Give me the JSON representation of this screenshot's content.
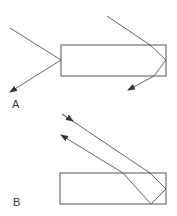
{
  "panels": [
    {
      "label": "A",
      "label_pos": [
        12,
        98
      ],
      "block": {
        "x": 61,
        "y": 45,
        "w": 105,
        "h": 31
      },
      "rays": [
        {
          "name": "ray-a-left",
          "points": [
            [
              10,
              28
            ],
            [
              61,
              60
            ],
            [
              10,
              92
            ]
          ],
          "arrow": "end"
        },
        {
          "name": "ray-a-right",
          "points": [
            [
              107,
              16
            ],
            [
              150,
              45
            ],
            [
              166,
              60
            ],
            [
              154,
              76
            ],
            [
              128,
              90
            ]
          ],
          "arrow": "end"
        }
      ]
    },
    {
      "label": "B",
      "label_pos": [
        13,
        196
      ],
      "block": {
        "x": 60,
        "y": 173,
        "w": 106,
        "h": 31
      },
      "rays": [
        {
          "name": "ray-b-incoming",
          "points": [
            [
              62,
              114
            ],
            [
              150,
              173
            ],
            [
              166,
              189
            ],
            [
              151,
              204
            ],
            [
              123,
              173
            ],
            [
              61,
              135
            ]
          ],
          "arrow_mid": [
            [
              62,
              114
            ],
            [
              73,
              121
            ]
          ],
          "arrow": "end"
        }
      ]
    }
  ],
  "colors": {
    "stroke": "#555555",
    "arrow": "#333333",
    "label": "#333333"
  }
}
